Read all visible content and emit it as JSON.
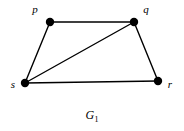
{
  "figure": {
    "caption_symbol": "G",
    "caption_subscript": "1",
    "background_color": "#ffffff",
    "ink_color": "#000000"
  },
  "chart_data": {
    "type": "diagram",
    "title": "G1",
    "graph_kind": "undirected-simple-graph",
    "vertex_count": 4,
    "edge_count": 5,
    "nodes": [
      {
        "id": "p",
        "label": "p",
        "x": 50,
        "y": 22,
        "label_x": 35,
        "label_y": 9,
        "degree": 2
      },
      {
        "id": "q",
        "label": "q",
        "x": 134,
        "y": 22,
        "label_x": 146,
        "label_y": 9,
        "degree": 3
      },
      {
        "id": "s",
        "label": "s",
        "x": 25,
        "y": 83,
        "label_x": 13,
        "label_y": 84,
        "degree": 3
      },
      {
        "id": "r",
        "label": "r",
        "x": 158,
        "y": 81,
        "label_x": 170,
        "label_y": 84,
        "degree": 2
      }
    ],
    "edges": [
      {
        "from": "p",
        "to": "q"
      },
      {
        "from": "p",
        "to": "s"
      },
      {
        "from": "s",
        "to": "q"
      },
      {
        "from": "s",
        "to": "r"
      },
      {
        "from": "q",
        "to": "r"
      }
    ],
    "node_radius": 4.2,
    "edge_width": 1.4
  }
}
